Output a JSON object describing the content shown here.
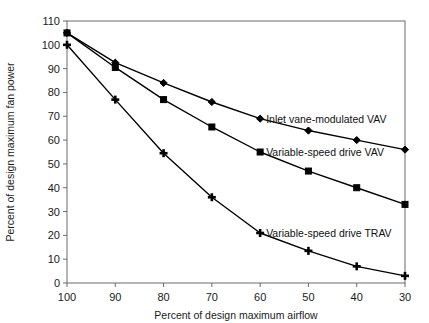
{
  "chart_data": {
    "type": "line",
    "title": "",
    "xlabel": "Percent of design maximum airflow",
    "ylabel": "Percent of design maximum fan power",
    "x": [
      100,
      90,
      80,
      70,
      60,
      50,
      40,
      30
    ],
    "xlim": [
      100,
      30
    ],
    "ylim": [
      0,
      110
    ],
    "x_ticks": [
      "100",
      "90",
      "80",
      "70",
      "60",
      "50",
      "40",
      "30"
    ],
    "y_ticks": [
      "0",
      "10",
      "20",
      "30",
      "40",
      "50",
      "60",
      "70",
      "80",
      "90",
      "100",
      "110"
    ],
    "grid": false,
    "legend_position": "inline-annotations",
    "series": [
      {
        "name": "Inlet vane-modulated VAV",
        "marker": "diamond",
        "values": [
          105,
          92.5,
          84,
          76,
          69,
          64,
          60,
          56
        ],
        "label_anchor_x": 60,
        "label_anchor_y": 69
      },
      {
        "name": "Variable-speed drive VAV",
        "marker": "square",
        "values": [
          105,
          90.5,
          77,
          65.5,
          55,
          47,
          40,
          33
        ],
        "label_anchor_x": 60,
        "label_anchor_y": 55
      },
      {
        "name": "Variable-speed drive TRAV",
        "marker": "plus",
        "values": [
          100,
          77,
          54.5,
          36,
          21,
          13.5,
          7,
          3
        ],
        "label_anchor_x": 60,
        "label_anchor_y": 21
      }
    ],
    "colors": {
      "line": "#000000",
      "marker": "#000000",
      "axis": "#6b6b6b",
      "text": "#1a1a1a",
      "background": "#ffffff"
    }
  }
}
